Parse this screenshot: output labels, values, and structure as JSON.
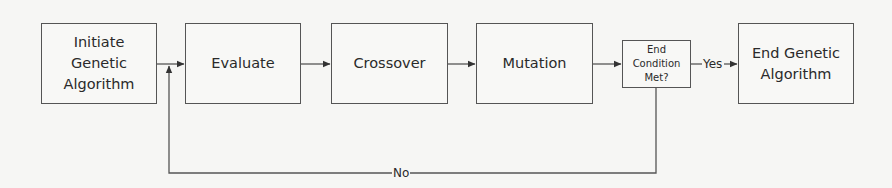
{
  "diagram": {
    "type": "flowchart",
    "nodes": [
      {
        "id": "initiate",
        "label": "Initiate Genetic Algorithm",
        "lines": [
          "Initiate",
          "Genetic",
          "Algorithm"
        ]
      },
      {
        "id": "evaluate",
        "label": "Evaluate"
      },
      {
        "id": "crossover",
        "label": "Crossover"
      },
      {
        "id": "mutation",
        "label": "Mutation"
      },
      {
        "id": "end_condition",
        "label": "End Condition Met?",
        "lines": [
          "End",
          "Condition",
          "Met?"
        ]
      },
      {
        "id": "end",
        "label": "End Genetic Algorithm",
        "lines": [
          "End Genetic",
          "Algorithm"
        ]
      }
    ],
    "edges": [
      {
        "from": "initiate",
        "to": "evaluate",
        "label": ""
      },
      {
        "from": "evaluate",
        "to": "crossover",
        "label": ""
      },
      {
        "from": "crossover",
        "to": "mutation",
        "label": ""
      },
      {
        "from": "mutation",
        "to": "end_condition",
        "label": ""
      },
      {
        "from": "end_condition",
        "to": "end",
        "label": "Yes"
      },
      {
        "from": "end_condition",
        "to": "evaluate",
        "label": "No"
      }
    ]
  },
  "colors": {
    "line": "#555555",
    "text": "#2a2a2a",
    "background": "#f6f6f4"
  }
}
